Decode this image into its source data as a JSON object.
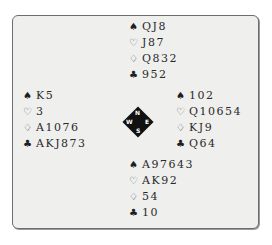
{
  "compass": {
    "n": "N",
    "s": "S",
    "w": "W",
    "e": "E"
  },
  "suits": {
    "spades": "♠",
    "hearts": "♡",
    "diamonds": "♢",
    "clubs": "♣"
  },
  "hands": {
    "north": {
      "spades": "QJ8",
      "hearts": "J87",
      "diamonds": "Q832",
      "clubs": "952"
    },
    "west": {
      "spades": "K5",
      "hearts": "3",
      "diamonds": "A1076",
      "clubs": "AKJ873"
    },
    "east": {
      "spades": "102",
      "hearts": "Q10654",
      "diamonds": "KJ9",
      "clubs": "Q64"
    },
    "south": {
      "spades": "A97643",
      "hearts": "AK92",
      "diamonds": "54",
      "clubs": "10"
    }
  }
}
